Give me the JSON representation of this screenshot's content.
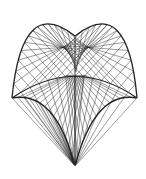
{
  "figure": {
    "title": "Cross-vaulted shell surface wireframe",
    "background": "#ffffff",
    "line_color": "#222222",
    "edge_color": "#888888",
    "points": {
      "left_corner": [
        12,
        98
      ],
      "right_corner": [
        137,
        98
      ],
      "bottom_apex": [
        75,
        166
      ],
      "top_dip": [
        75,
        36
      ],
      "left_peak": [
        53,
        19
      ],
      "right_peak": [
        97,
        19
      ],
      "center_node": [
        76,
        75
      ]
    },
    "grid_lines_per_direction": 14
  }
}
